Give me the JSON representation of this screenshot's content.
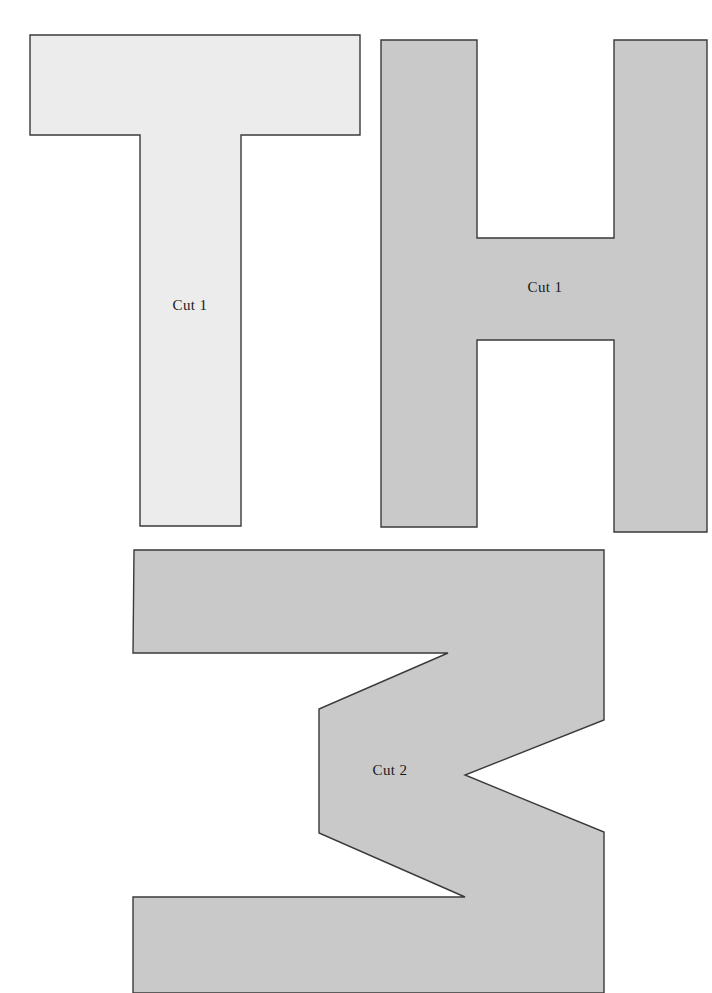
{
  "page": {
    "background_color": "#ffffff",
    "width": 712,
    "height": 993
  },
  "style": {
    "outline_color": "#3a3a3a",
    "outline_width": 1.4,
    "light_fill": "#ececec",
    "mid_fill": "#c9c9c9",
    "label_color": "#1a1a1a",
    "label_font_size": 15
  },
  "shapes": [
    {
      "id": "t-shape",
      "name": "letter-t-shape",
      "label": "Cut 1",
      "fill": "#ececec",
      "label_x": 190,
      "label_y": 307,
      "points": "30,35 360,35 360,135 241,135 241,526 140,526 140,135 30,135"
    },
    {
      "id": "h-shape",
      "name": "letter-h-shape",
      "label": "Cut 1",
      "fill": "#c9c9c9",
      "label_x": 545,
      "label_y": 289,
      "points": "381,40 477,40 477,238 614,238 614,40 707,40 707,532 614,532 614,340 477,340 477,527 381,527"
    },
    {
      "id": "z-shape",
      "name": "letter-z-shape",
      "label": "Cut 2",
      "fill": "#c9c9c9",
      "label_x": 390,
      "label_y": 772,
      "points": "134,550 604,550 604,720 465,775 604,832 604,993 133,993 133,897 465,897 319,833 319,709 448,653 133,653"
    }
  ],
  "labels": {
    "cut1": "Cut 1",
    "cut2": "Cut 2"
  }
}
